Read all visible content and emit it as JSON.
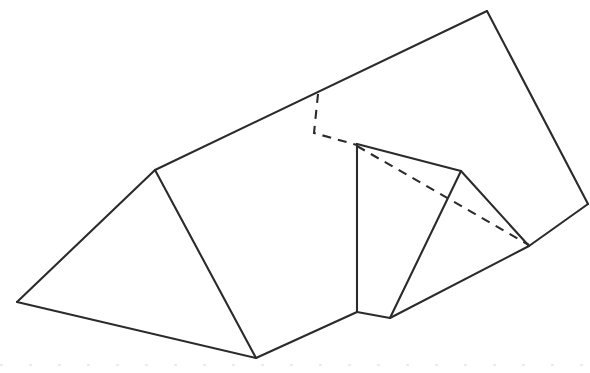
{
  "figure": {
    "canvas": {
      "width": 590,
      "height": 373,
      "background": "#ffffff"
    },
    "style": {
      "line_color": "#2b2b2b",
      "line_width": 2.1,
      "hidden_dash_pattern": "9 7",
      "artifact_color": "#d8d8d8"
    },
    "vertices": {
      "left_base": "17,302",
      "ridge_left": "155,170",
      "bottom_front": "256,358",
      "branch_top": "318,94",
      "branch_elbow": "314,133",
      "inner_top": "357,144",
      "inner_bottom": "357,312",
      "notch_bottom": "390,318",
      "mid_peak": "461,171",
      "apex_top": "487,11",
      "right_edge": "588,204",
      "right_tip": "529,246"
    },
    "edges": {
      "solid": [
        {
          "name": "left-base-to-ridge",
          "d": "M 17,302 L 155,170"
        },
        {
          "name": "ridge-to-apex",
          "d": "M 155,170 L 487,11"
        },
        {
          "name": "apex-to-right-edge",
          "d": "M 487,11 L 588,204"
        },
        {
          "name": "right-edge-to-right-tip",
          "d": "M 588,204 L 529,246"
        },
        {
          "name": "left-base-to-bottom-front",
          "d": "M 17,302 L 256,358"
        },
        {
          "name": "ridge-to-bottom-front",
          "d": "M 155,170 L 256,358"
        },
        {
          "name": "bottom-front-to-inner-bottom",
          "d": "M 256,358 L 357,312"
        },
        {
          "name": "inner-vertical",
          "d": "M 357,144 L 357,312"
        },
        {
          "name": "inner-bottom-to-notch",
          "d": "M 357,312 L 390,318"
        },
        {
          "name": "inner-top-to-mid-peak",
          "d": "M 357,144 L 461,171"
        },
        {
          "name": "mid-peak-to-notch",
          "d": "M 461,171 L 390,318"
        },
        {
          "name": "notch-to-right-tip",
          "d": "M 390,318 L 529,246"
        },
        {
          "name": "mid-peak-to-right-tip",
          "d": "M 461,171 L 529,246"
        }
      ],
      "hidden": [
        {
          "name": "apex-drop-dashed",
          "d": "M 318,94 L 314,133 L 357,145"
        },
        {
          "name": "inner-diagonal-dashed",
          "d": "M 357,146 L 529,245"
        }
      ]
    },
    "artifacts": [
      {
        "name": "scanner-baseline",
        "d": "M 0,365 L 590,365"
      }
    ]
  }
}
